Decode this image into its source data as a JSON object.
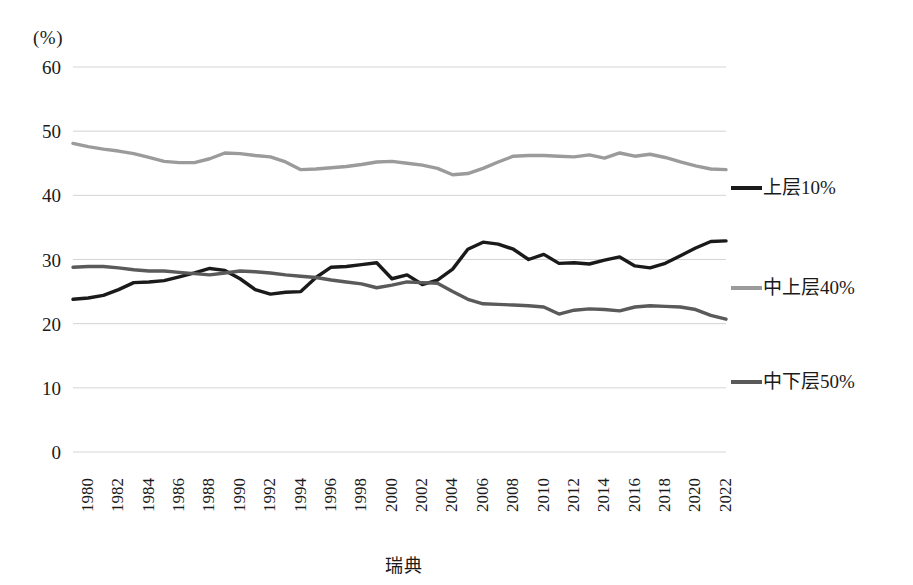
{
  "caption": "瑞典",
  "chart_data": {
    "type": "line",
    "title": "",
    "subtitle": "",
    "xlabel": "",
    "ylabel": "(%)",
    "unit_label": "(%)",
    "grid": true,
    "legend_position": "right",
    "ylim": [
      0,
      60
    ],
    "yticks": [
      60,
      50,
      40,
      30,
      20,
      10,
      0
    ],
    "xlim": [
      1980,
      2023
    ],
    "xticks": [
      1980,
      1982,
      1984,
      1986,
      1988,
      1990,
      1992,
      1994,
      1996,
      1998,
      2000,
      2002,
      2004,
      2006,
      2008,
      2010,
      2012,
      2014,
      2016,
      2018,
      2020,
      2022
    ],
    "x": [
      1980,
      1981,
      1982,
      1983,
      1984,
      1985,
      1986,
      1987,
      1988,
      1989,
      1990,
      1991,
      1992,
      1993,
      1994,
      1995,
      1996,
      1997,
      1998,
      1999,
      2000,
      2001,
      2002,
      2003,
      2004,
      2005,
      2006,
      2007,
      2008,
      2009,
      2010,
      2011,
      2012,
      2013,
      2014,
      2015,
      2016,
      2017,
      2018,
      2019,
      2020,
      2021,
      2022,
      2023
    ],
    "series": [
      {
        "name": "上层10%",
        "color": "#1a1a1a",
        "width": 3.4,
        "values": [
          23.8,
          24.0,
          24.4,
          25.3,
          26.4,
          26.5,
          26.7,
          27.3,
          27.9,
          28.6,
          28.3,
          27.0,
          25.3,
          24.6,
          24.9,
          25.0,
          27.2,
          28.8,
          28.9,
          29.2,
          29.5,
          27.0,
          27.6,
          26.1,
          26.8,
          28.5,
          31.6,
          32.7,
          32.4,
          31.6,
          30.0,
          30.8,
          29.4,
          29.5,
          29.3,
          29.9,
          30.4,
          29.0,
          28.7,
          29.4,
          30.6,
          31.8,
          32.8,
          32.9
        ]
      },
      {
        "name": "中上层40%",
        "color": "#9b9b9b",
        "width": 3.4,
        "values": [
          48.1,
          47.6,
          47.2,
          46.9,
          46.5,
          45.9,
          45.3,
          45.1,
          45.1,
          45.7,
          46.6,
          46.5,
          46.2,
          46.0,
          45.2,
          44.0,
          44.1,
          44.3,
          44.5,
          44.8,
          45.2,
          45.3,
          45.0,
          44.7,
          44.2,
          43.2,
          43.4,
          44.2,
          45.2,
          46.1,
          46.2,
          46.2,
          46.1,
          46.0,
          46.3,
          45.8,
          46.6,
          46.1,
          46.4,
          45.9,
          45.2,
          44.6,
          44.1,
          44.0
        ]
      },
      {
        "name": "中下层50%",
        "color": "#5a5a5a",
        "width": 3.4,
        "values": [
          28.8,
          28.9,
          28.9,
          28.7,
          28.4,
          28.2,
          28.2,
          28.0,
          27.8,
          27.6,
          27.9,
          28.2,
          28.1,
          27.9,
          27.6,
          27.4,
          27.2,
          26.8,
          26.5,
          26.2,
          25.6,
          26.0,
          26.5,
          26.4,
          26.3,
          25.0,
          23.8,
          23.1,
          23.0,
          22.9,
          22.8,
          22.6,
          21.5,
          22.1,
          22.3,
          22.2,
          22.0,
          22.6,
          22.8,
          22.7,
          22.6,
          22.2,
          21.3,
          20.7
        ]
      }
    ]
  }
}
